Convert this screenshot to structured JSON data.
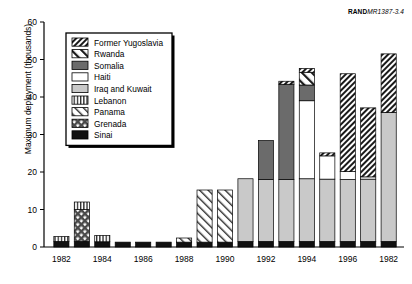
{
  "credit": {
    "brand": "RAND",
    "code": "MR1387-3.4"
  },
  "chart_data": {
    "type": "bar",
    "title": "",
    "subtitle": "",
    "xlabel": "",
    "ylabel": "Maximum deployment (thousands)",
    "ylim": [
      0,
      60
    ],
    "yticks": [
      0,
      10,
      20,
      30,
      40,
      50,
      60
    ],
    "ytick_labels": [
      "0",
      "10",
      "20",
      "30",
      "40",
      "50",
      "60"
    ],
    "grid": false,
    "stacked": true,
    "legend_position": "inside-top-left",
    "legend": [
      "Former Yugoslavia",
      "Rwanda",
      "Somalia",
      "Haiti",
      "Iraq and Kuwait",
      "Lebanon",
      "Panama",
      "Grenada",
      "Sinai"
    ],
    "categories": [
      "1982",
      "",
      "1984",
      "",
      "1986",
      "",
      "1988",
      "",
      "1990",
      "",
      "1992",
      "",
      "1994",
      "",
      "1996",
      "",
      "1982"
    ],
    "xtick_labels": [
      "1982",
      "1984",
      "1986",
      "1988",
      "1990",
      "1992",
      "1994",
      "1996",
      "1982"
    ],
    "bars": [
      {
        "label": "1982",
        "total": 2.8,
        "segments": [
          {
            "name": "Sinai",
            "value": 1.5
          },
          {
            "name": "Lebanon",
            "value": 1.3
          }
        ]
      },
      {
        "label": "1983",
        "total": 12.0,
        "segments": [
          {
            "name": "Sinai",
            "value": 1.5
          },
          {
            "name": "Grenada",
            "value": 8.5
          },
          {
            "name": "Lebanon",
            "value": 2.0
          }
        ]
      },
      {
        "label": "1984",
        "total": 3.1,
        "segments": [
          {
            "name": "Sinai",
            "value": 1.4
          },
          {
            "name": "Lebanon",
            "value": 1.7
          }
        ]
      },
      {
        "label": "1985",
        "total": 1.3,
        "segments": [
          {
            "name": "Sinai",
            "value": 1.3
          }
        ]
      },
      {
        "label": "1986",
        "total": 1.3,
        "segments": [
          {
            "name": "Sinai",
            "value": 1.3
          }
        ]
      },
      {
        "label": "1987",
        "total": 1.3,
        "segments": [
          {
            "name": "Sinai",
            "value": 1.3
          }
        ]
      },
      {
        "label": "1988",
        "total": 2.4,
        "segments": [
          {
            "name": "Sinai",
            "value": 1.3
          },
          {
            "name": "Panama",
            "value": 1.1
          }
        ]
      },
      {
        "label": "1989",
        "total": 15.2,
        "segments": [
          {
            "name": "Sinai",
            "value": 1.3
          },
          {
            "name": "Panama",
            "value": 13.9
          }
        ]
      },
      {
        "label": "1990",
        "total": 15.2,
        "segments": [
          {
            "name": "Sinai",
            "value": 1.3
          },
          {
            "name": "Panama",
            "value": 13.9
          }
        ]
      },
      {
        "label": "1991",
        "total": 18.2,
        "segments": [
          {
            "name": "Sinai",
            "value": 1.5
          },
          {
            "name": "Iraq and Kuwait",
            "value": 16.7
          }
        ]
      },
      {
        "label": "1992",
        "total": 28.4,
        "segments": [
          {
            "name": "Sinai",
            "value": 1.5
          },
          {
            "name": "Iraq and Kuwait",
            "value": 16.5
          },
          {
            "name": "Somalia",
            "value": 10.4
          }
        ]
      },
      {
        "label": "1993",
        "total": 44.2,
        "segments": [
          {
            "name": "Sinai",
            "value": 1.5
          },
          {
            "name": "Iraq and Kuwait",
            "value": 16.5
          },
          {
            "name": "Somalia",
            "value": 25.4
          },
          {
            "name": "Former Yugoslavia",
            "value": 0.8
          }
        ]
      },
      {
        "label": "1994",
        "total": 47.6,
        "segments": [
          {
            "name": "Sinai",
            "value": 1.5
          },
          {
            "name": "Iraq and Kuwait",
            "value": 16.7
          },
          {
            "name": "Haiti",
            "value": 20.8
          },
          {
            "name": "Somalia",
            "value": 4.2
          },
          {
            "name": "Rwanda",
            "value": 3.4
          },
          {
            "name": "Former Yugoslavia",
            "value": 1.0
          }
        ]
      },
      {
        "label": "1995",
        "total": 25.1,
        "segments": [
          {
            "name": "Sinai",
            "value": 1.5
          },
          {
            "name": "Iraq and Kuwait",
            "value": 16.6
          },
          {
            "name": "Haiti",
            "value": 6.2
          },
          {
            "name": "Former Yugoslavia",
            "value": 0.8
          }
        ]
      },
      {
        "label": "1996",
        "total": 46.2,
        "segments": [
          {
            "name": "Sinai",
            "value": 1.5
          },
          {
            "name": "Iraq and Kuwait",
            "value": 16.5
          },
          {
            "name": "Haiti",
            "value": 2.1
          },
          {
            "name": "Former Yugoslavia",
            "value": 26.1
          }
        ]
      },
      {
        "label": "1997",
        "total": 37.1,
        "segments": [
          {
            "name": "Sinai",
            "value": 1.5
          },
          {
            "name": "Iraq and Kuwait",
            "value": 16.6
          },
          {
            "name": "Haiti",
            "value": 0.6
          },
          {
            "name": "Former Yugoslavia",
            "value": 18.4
          }
        ]
      },
      {
        "label": "1998",
        "total": 51.5,
        "segments": [
          {
            "name": "Sinai",
            "value": 1.5
          },
          {
            "name": "Iraq and Kuwait",
            "value": 34.4
          },
          {
            "name": "Former Yugoslavia",
            "value": 15.6
          }
        ]
      }
    ],
    "colors": {
      "Former Yugoslavia": "#ffffff",
      "Rwanda": "#ffffff",
      "Somalia": "#6b6b6b",
      "Haiti": "#ffffff",
      "Iraq and Kuwait": "#c9c9c9",
      "Lebanon": "#ffffff",
      "Panama": "#ffffff",
      "Grenada": "#ffffff",
      "Sinai": "#111111"
    }
  }
}
